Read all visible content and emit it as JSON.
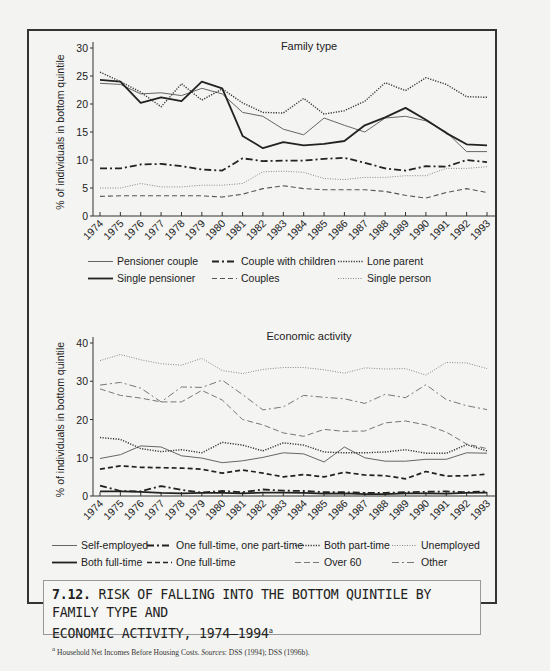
{
  "caption": {
    "number": "7.12.",
    "title": "RISK OF FALLING INTO THE BOTTOM QUINTILE BY FAMILY TYPE AND ECONOMIC ACTIVITY, 1974–1994",
    "title_line1": "RISK OF FALLING INTO THE BOTTOM QUINTILE BY FAMILY TYPE AND",
    "title_line2": "ECONOMIC ACTIVITY, 1974–1994",
    "footnote_marker": "a",
    "footnote": "Household Net Incomes Before Housing Costs.",
    "sources_label": "Sources",
    "sources": ": DSS (1994); DSS (1996b)."
  },
  "chart_data": [
    {
      "type": "line",
      "title": "Family type",
      "xlabel": "",
      "ylabel": "% of individuals in bottom quintile",
      "ylim": [
        0,
        30
      ],
      "yticks": [
        0,
        5,
        10,
        15,
        20,
        25,
        30
      ],
      "grid": false,
      "legend_position": "bottom",
      "x": [
        "1974",
        "1975",
        "1976",
        "1977",
        "1978",
        "1979",
        "1980",
        "1981",
        "1982",
        "1983",
        "1984",
        "1985",
        "1986",
        "1987",
        "1988",
        "1989",
        "1990",
        "1991",
        "1992",
        "1993"
      ],
      "series": [
        {
          "name": "Pensioner couple",
          "style": "solid-thin",
          "values": [
            23.7,
            23.5,
            21.8,
            22.0,
            21.5,
            22.8,
            21.8,
            18.5,
            17.8,
            15.5,
            14.5,
            17.5,
            16.2,
            15.0,
            17.5,
            17.8,
            17.0,
            15.0,
            11.5,
            11.5
          ]
        },
        {
          "name": "Single pensioner",
          "style": "solid-thick",
          "values": [
            24.3,
            24.0,
            20.2,
            21.2,
            20.5,
            24.0,
            22.8,
            14.3,
            12.1,
            13.2,
            12.6,
            12.9,
            13.4,
            16.2,
            17.6,
            19.3,
            17.2,
            14.8,
            12.8,
            12.6
          ]
        },
        {
          "name": "Couple with children",
          "style": "dash-dot-thick",
          "values": [
            8.5,
            8.5,
            9.2,
            9.3,
            8.9,
            8.3,
            8.1,
            10.3,
            9.8,
            9.9,
            9.9,
            10.2,
            10.4,
            9.5,
            8.5,
            8.1,
            8.9,
            8.8,
            10.0,
            9.6
          ]
        },
        {
          "name": "Couples",
          "style": "dashed",
          "values": [
            3.5,
            3.6,
            3.6,
            3.6,
            3.6,
            3.6,
            3.4,
            3.9,
            4.9,
            5.4,
            4.9,
            4.7,
            4.7,
            4.7,
            4.4,
            3.7,
            3.2,
            4.2,
            4.9,
            4.2
          ]
        },
        {
          "name": "Lone parent",
          "style": "dotted-thick",
          "values": [
            25.7,
            24.0,
            22.1,
            19.5,
            23.6,
            20.7,
            22.7,
            20.2,
            18.5,
            18.4,
            21.0,
            18.2,
            18.8,
            20.5,
            23.8,
            22.4,
            24.7,
            23.5,
            21.3,
            21.2
          ]
        },
        {
          "name": "Single person",
          "style": "dotted-thin",
          "values": [
            5.0,
            5.0,
            5.8,
            5.2,
            5.2,
            5.5,
            5.5,
            5.8,
            7.9,
            8.0,
            7.8,
            6.7,
            6.5,
            6.9,
            6.9,
            7.2,
            7.2,
            8.5,
            8.5,
            8.8
          ]
        }
      ]
    },
    {
      "type": "line",
      "title": "Economic activity",
      "xlabel": "",
      "ylabel": "% of individuals in bottom quintile",
      "ylim": [
        0,
        40
      ],
      "yticks": [
        0,
        10,
        20,
        30,
        40
      ],
      "grid": false,
      "legend_position": "bottom",
      "x": [
        "1974",
        "1975",
        "1976",
        "1977",
        "1978",
        "1979",
        "1980",
        "1981",
        "1982",
        "1983",
        "1984",
        "1985",
        "1986",
        "1987",
        "1988",
        "1989",
        "1990",
        "1991",
        "1992",
        "1993"
      ],
      "series": [
        {
          "name": "Self-employed",
          "style": "solid-thin",
          "values": [
            9.8,
            10.8,
            13.1,
            12.8,
            10.5,
            9.9,
            8.7,
            9.2,
            10.1,
            11.3,
            11.0,
            8.9,
            12.8,
            10.0,
            9.1,
            9.1,
            9.6,
            9.6,
            11.3,
            11.2
          ]
        },
        {
          "name": "Both full-time",
          "style": "solid-thick",
          "values": [
            1.2,
            1.2,
            1.1,
            0.8,
            0.7,
            0.8,
            0.8,
            0.7,
            0.9,
            0.9,
            0.8,
            0.6,
            0.7,
            0.5,
            0.5,
            0.7,
            0.7,
            0.6,
            0.8,
            0.9
          ]
        },
        {
          "name": "One full-time, one part-time",
          "style": "dash-dot-thick",
          "values": [
            2.7,
            1.3,
            1.2,
            2.6,
            1.6,
            0.9,
            1.3,
            1.0,
            1.7,
            1.4,
            1.3,
            1.0,
            1.0,
            0.8,
            0.8,
            1.0,
            1.1,
            1.2,
            1.0,
            1.2
          ]
        },
        {
          "name": "One full-time",
          "style": "dashed-thick",
          "values": [
            7.0,
            7.9,
            7.5,
            7.4,
            7.3,
            7.0,
            6.0,
            6.8,
            6.0,
            5.0,
            5.6,
            5.0,
            6.2,
            5.5,
            5.3,
            4.5,
            6.4,
            5.2,
            5.3,
            5.7
          ]
        },
        {
          "name": "Both part-time",
          "style": "dotted-thick",
          "values": [
            15.3,
            14.8,
            12.4,
            11.6,
            12.1,
            11.3,
            14.0,
            13.3,
            11.8,
            13.9,
            13.3,
            11.5,
            11.3,
            11.3,
            11.5,
            12.1,
            11.2,
            11.2,
            13.4,
            11.8
          ]
        },
        {
          "name": "Over 60",
          "style": "dashed-thin",
          "values": [
            28.0,
            26.3,
            25.6,
            24.6,
            24.6,
            27.6,
            25.1,
            20.0,
            18.6,
            16.5,
            15.6,
            17.4,
            16.9,
            17.0,
            19.1,
            19.6,
            18.6,
            16.7,
            13.6,
            12.4
          ]
        },
        {
          "name": "Unemployed",
          "style": "dotted-thin",
          "values": [
            35.4,
            37.0,
            35.6,
            34.6,
            34.2,
            36.0,
            32.8,
            32.0,
            33.1,
            33.6,
            33.6,
            33.0,
            32.1,
            33.5,
            33.2,
            33.3,
            31.6,
            34.9,
            34.8,
            33.3
          ]
        },
        {
          "name": "Other",
          "style": "dash-dot-thin",
          "values": [
            29.0,
            29.7,
            28.2,
            24.6,
            28.5,
            28.4,
            30.3,
            26.5,
            22.5,
            23.3,
            26.3,
            25.8,
            25.4,
            24.2,
            26.6,
            25.7,
            29.1,
            25.2,
            23.6,
            22.6
          ]
        }
      ]
    }
  ],
  "legends": [
    {
      "rows": [
        [
          "Pensioner couple",
          "Couple with children",
          "Lone parent"
        ],
        [
          "Single pensioner",
          "Couples",
          "Single person"
        ]
      ]
    },
    {
      "rows": [
        [
          "Self-employed",
          "One full-time, one part-time",
          "Both part-time",
          "Unemployed"
        ],
        [
          "Both full-time",
          "One full-time",
          "Over 60",
          "Other"
        ]
      ]
    }
  ]
}
